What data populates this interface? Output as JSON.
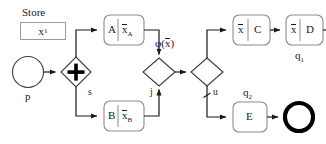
{
  "diagram": {
    "type": "bpmn-process-flow",
    "title_annotation": {
      "store_label": "Store",
      "store_value": "x",
      "store_value_sub": "1"
    },
    "start_event": {
      "id": "p",
      "label": "p",
      "shape": "circle-thin"
    },
    "gateways": [
      {
        "id": "s",
        "label": "s",
        "kind": "parallel-split",
        "marker": "plus"
      },
      {
        "id": "j",
        "label": "j",
        "kind": "join",
        "marker": "none"
      },
      {
        "id": "u",
        "label": "u",
        "kind": "exclusive-split",
        "marker": "none"
      }
    ],
    "tasks": [
      {
        "id": "A",
        "left_text": "A",
        "right_text": "x",
        "right_sub": "A",
        "right_overline": true,
        "divider": true
      },
      {
        "id": "B",
        "left_text": "B",
        "right_text": "x",
        "right_sub": "B",
        "right_overline": true,
        "divider": true
      },
      {
        "id": "C",
        "left_text": "x",
        "left_overline": true,
        "right_text": "C",
        "divider": true
      },
      {
        "id": "D",
        "left_text": "x",
        "left_overline": true,
        "right_text": "D",
        "divider": true
      },
      {
        "id": "E",
        "left_text": "E",
        "divider": false
      }
    ],
    "end_events": [
      {
        "id": "q1",
        "label": "q",
        "label_sub": "1",
        "shape": "circle-thick",
        "label_position": "below"
      },
      {
        "id": "q2",
        "label": "q",
        "label_sub": "2",
        "shape": "circle-thick",
        "label_position": "above"
      }
    ],
    "annotations": [
      {
        "id": "phi",
        "text_prefix": "φ(",
        "text_var": "x",
        "text_var_overline": true,
        "text_suffix": ")"
      }
    ],
    "flows": [
      {
        "from": "p",
        "to": "s"
      },
      {
        "from": "s",
        "to": "A"
      },
      {
        "from": "s",
        "to": "B"
      },
      {
        "from": "A",
        "to": "j"
      },
      {
        "from": "B",
        "to": "j"
      },
      {
        "from": "j",
        "to": "u"
      },
      {
        "from": "u",
        "to": "C",
        "condition": "phi"
      },
      {
        "from": "u",
        "to": "E",
        "default": true
      },
      {
        "from": "C",
        "to": "D"
      },
      {
        "from": "D",
        "to": "q1"
      },
      {
        "from": "E",
        "to": "q2"
      }
    ],
    "colors": {
      "stroke": "#1a1a1a",
      "task_stroke": "#8c8c8c",
      "store_stroke": "#9a9a9a",
      "background": "#ffffff"
    }
  }
}
